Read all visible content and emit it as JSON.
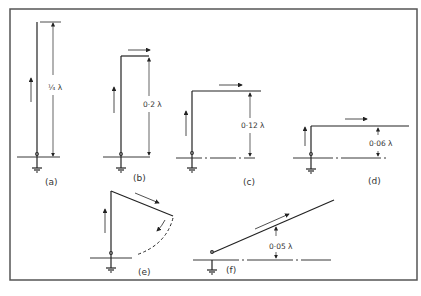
{
  "figure": {
    "frame_color": "#555555",
    "line_color": "#222222",
    "panels": [
      {
        "id": "a",
        "label": "(a)",
        "dimension": "¼ λ",
        "description": "vertical quarter-wave monopole"
      },
      {
        "id": "b",
        "label": "(b)",
        "dimension": "0·2 λ",
        "description": "inverted-L, tall vertical"
      },
      {
        "id": "c",
        "label": "(c)",
        "dimension": "0·12 λ",
        "description": "inverted-L, medium vertical"
      },
      {
        "id": "d",
        "label": "(d)",
        "dimension": "0·06 λ",
        "description": "inverted-L, short vertical"
      },
      {
        "id": "e",
        "label": "(e)",
        "dimension": "",
        "description": "vertical with sloping top section swinging down"
      },
      {
        "id": "f",
        "label": "(f)",
        "dimension": "0·05 λ",
        "description": "sloping wire fed near ground"
      }
    ]
  }
}
